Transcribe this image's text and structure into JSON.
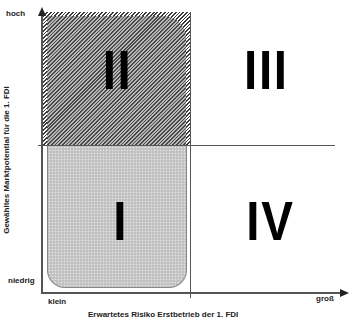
{
  "diagram": {
    "y_axis": {
      "title": "Gewähltes  Marktpotential für die  1. FDI",
      "top_label": "hoch",
      "bottom_label": "niedrig"
    },
    "x_axis": {
      "title": "Erwartetes Risiko          Erstbetrieb der 1. FDI",
      "left_label": "klein",
      "right_label": "groß"
    },
    "quadrants": [
      {
        "id": "I",
        "label": "I",
        "position": "bottom-left",
        "fill": "dotted-gray"
      },
      {
        "id": "II",
        "label": "II",
        "position": "top-left",
        "fill": "hatched"
      },
      {
        "id": "III",
        "label": "III",
        "position": "top-right",
        "fill": "none"
      },
      {
        "id": "IV",
        "label": "IV",
        "position": "bottom-right",
        "fill": "none"
      }
    ],
    "colors": {
      "axis": "#333333",
      "hatch_dark": "#3a3a3a",
      "dotted_fill": "#c9c9c9",
      "text": "#000000"
    }
  }
}
